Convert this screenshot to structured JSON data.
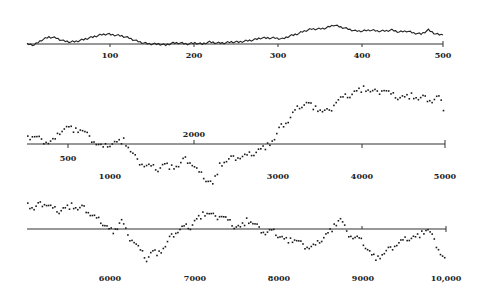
{
  "chart_data": [
    {
      "type": "line",
      "panel": 1,
      "title": "",
      "xlabel": "",
      "ylabel": "",
      "xlim": [
        0,
        500
      ],
      "ticks": [
        100,
        200,
        300,
        400,
        500
      ],
      "tick_labels": [
        "100",
        "200",
        "300",
        "400",
        "500"
      ],
      "grid": false,
      "axis_px": {
        "y": 44,
        "x0": 27,
        "x1": 443
      },
      "tick_label_y": [
        55,
        55,
        55,
        55,
        55
      ],
      "x": [
        0,
        8,
        16,
        24,
        32,
        40,
        50,
        60,
        70,
        80,
        90,
        100,
        110,
        120,
        130,
        140,
        150,
        160,
        170,
        180,
        190,
        200,
        210,
        220,
        230,
        240,
        250,
        260,
        270,
        280,
        290,
        300,
        310,
        320,
        330,
        340,
        350,
        360,
        370,
        380,
        390,
        400,
        410,
        420,
        430,
        440,
        450,
        460,
        470,
        480,
        490,
        500
      ],
      "y_px": [
        44,
        45,
        40,
        37,
        38,
        41,
        42,
        41,
        39,
        37,
        35,
        34,
        35,
        36,
        38,
        41,
        43,
        44,
        44,
        45,
        43,
        43,
        44,
        43,
        44,
        42,
        43,
        43,
        42,
        42,
        41,
        40,
        38,
        38,
        38,
        39,
        36,
        34,
        31,
        29,
        29,
        28,
        25,
        27,
        29,
        31,
        31,
        30,
        31,
        31,
        30,
        32,
        31,
        33,
        34,
        30,
        34,
        35
      ],
      "values_note": "y_px are pixel heights relative to axis at y=44 (smaller = higher)"
    },
    {
      "type": "scatter",
      "panel": 2,
      "title": "",
      "xlabel": "",
      "ylabel": "",
      "xlim": [
        0,
        5000
      ],
      "ticks": [
        500,
        1000,
        2000,
        3000,
        4000,
        5000
      ],
      "tick_labels": [
        "500",
        "1000",
        "2000",
        "3000",
        "4000",
        "5000"
      ],
      "grid": false,
      "axis_px": {
        "y": 144,
        "x0": 27,
        "x1": 445
      },
      "x": [
        0,
        100,
        200,
        300,
        400,
        500,
        600,
        700,
        800,
        900,
        1000,
        1100,
        1200,
        1300,
        1400,
        1500,
        1600,
        1700,
        1800,
        1900,
        2000,
        2100,
        2200,
        2300,
        2400,
        2500,
        2600,
        2700,
        2800,
        2900,
        3000,
        3100,
        3200,
        3300,
        3400,
        3500,
        3600,
        3700,
        3800,
        3900,
        4000,
        4100,
        4200,
        4300,
        4400,
        4500,
        4600,
        4700,
        4800,
        4900,
        5000
      ],
      "y_px": [
        138,
        135,
        140,
        141,
        139,
        128,
        126,
        130,
        129,
        137,
        142,
        147,
        143,
        141,
        140,
        150,
        160,
        164,
        166,
        168,
        163,
        167,
        165,
        158,
        163,
        172,
        178,
        183,
        165,
        160,
        157,
        156,
        155,
        152,
        148,
        145,
        138,
        125,
        120,
        110,
        104,
        102,
        108,
        110,
        111,
        100,
        97,
        94,
        90,
        88,
        90,
        92,
        88,
        94,
        96,
        96,
        95,
        98,
        97,
        100,
        96,
        114
      ]
    },
    {
      "type": "scatter",
      "panel": 3,
      "title": "",
      "xlabel": "",
      "ylabel": "",
      "xlim": [
        5000,
        10000
      ],
      "ticks": [
        6000,
        7000,
        8000,
        9000,
        10000
      ],
      "tick_labels": [
        "6000",
        "7000",
        "8000",
        "9000",
        "10,000"
      ],
      "grid": false,
      "axis_px": {
        "y": 229,
        "x0": 27,
        "x1": 446
      },
      "x": [
        5000,
        5100,
        5200,
        5300,
        5400,
        5500,
        5600,
        5700,
        5800,
        5900,
        6000,
        6100,
        6200,
        6300,
        6400,
        6500,
        6600,
        6700,
        6800,
        6900,
        7000,
        7100,
        7200,
        7300,
        7400,
        7500,
        7600,
        7700,
        7800,
        7900,
        8000,
        8100,
        8200,
        8300,
        8400,
        8500,
        8600,
        8700,
        8800,
        8900,
        9000,
        9100,
        9200,
        9300,
        9400,
        9500,
        9600,
        9700,
        9800,
        9900,
        10000
      ],
      "y_px": [
        205,
        208,
        203,
        203,
        208,
        210,
        207,
        205,
        208,
        207,
        213,
        218,
        222,
        228,
        231,
        218,
        236,
        240,
        250,
        258,
        250,
        253,
        245,
        235,
        230,
        226,
        226,
        218,
        214,
        212,
        217,
        214,
        220,
        225,
        226,
        220,
        222,
        228,
        232,
        230,
        234,
        238,
        240,
        239,
        245,
        246,
        245,
        238,
        232,
        226,
        217,
        232,
        236,
        238,
        245,
        254,
        258,
        252,
        248,
        243,
        240,
        237,
        236,
        233,
        228,
        240,
        252,
        262
      ]
    }
  ],
  "panels": {
    "p1": {
      "labels": [
        "100",
        "200",
        "300",
        "400",
        "500"
      ]
    },
    "p2": {
      "label_500": "500",
      "label_1000": "1000",
      "label_2000": "2000",
      "label_3000": "3000",
      "label_4000": "4000",
      "label_5000": "5000"
    },
    "p3": {
      "labels": [
        "6000",
        "7000",
        "8000",
        "9000",
        "10,000"
      ]
    }
  }
}
